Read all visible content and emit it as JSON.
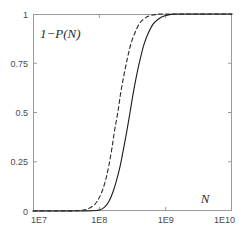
{
  "chart_data": {
    "type": "line",
    "title": "",
    "subtitle": "",
    "xlabel": "N",
    "ylabel": "1−P(N)",
    "xscale": "log",
    "yscale": "linear",
    "xlim": [
      10000000,
      10000000000
    ],
    "ylim": [
      0,
      1
    ],
    "grid": false,
    "legend": "none",
    "xticks": [
      {
        "value": 10000000,
        "label": "1E7"
      },
      {
        "value": 100000000,
        "label": "1E8"
      },
      {
        "value": 1000000000,
        "label": "1E9"
      },
      {
        "value": 10000000000,
        "label": "1E10"
      }
    ],
    "yticks": [
      {
        "value": 0,
        "label": "0"
      },
      {
        "value": 0.25,
        "label": "0.25"
      },
      {
        "value": 0.5,
        "label": "0.5"
      },
      {
        "value": 0.75,
        "label": "0.75"
      },
      {
        "value": 1,
        "label": "1"
      }
    ],
    "series": [
      {
        "name": "dashed-curve",
        "style": "dashed",
        "color": "#2b2b2b",
        "midpoint_x": 190000000,
        "points": [
          {
            "x": 10000000,
            "y": 0.0
          },
          {
            "x": 20000000,
            "y": 0.0
          },
          {
            "x": 40000000,
            "y": 0.001
          },
          {
            "x": 60000000,
            "y": 0.006
          },
          {
            "x": 80000000,
            "y": 0.025
          },
          {
            "x": 95000000,
            "y": 0.055
          },
          {
            "x": 110000000,
            "y": 0.1
          },
          {
            "x": 125000000,
            "y": 0.16
          },
          {
            "x": 140000000,
            "y": 0.235
          },
          {
            "x": 155000000,
            "y": 0.32
          },
          {
            "x": 170000000,
            "y": 0.41
          },
          {
            "x": 190000000,
            "y": 0.5
          },
          {
            "x": 210000000,
            "y": 0.6
          },
          {
            "x": 235000000,
            "y": 0.69
          },
          {
            "x": 265000000,
            "y": 0.775
          },
          {
            "x": 300000000,
            "y": 0.85
          },
          {
            "x": 345000000,
            "y": 0.905
          },
          {
            "x": 400000000,
            "y": 0.95
          },
          {
            "x": 470000000,
            "y": 0.975
          },
          {
            "x": 560000000,
            "y": 0.99
          },
          {
            "x": 700000000,
            "y": 0.997
          },
          {
            "x": 1000000000,
            "y": 1.0
          },
          {
            "x": 10000000000,
            "y": 1.0
          }
        ]
      },
      {
        "name": "solid-curve",
        "style": "solid",
        "color": "#1a1a1a",
        "midpoint_x": 290000000,
        "points": [
          {
            "x": 10000000,
            "y": 0.0
          },
          {
            "x": 40000000,
            "y": 0.0
          },
          {
            "x": 80000000,
            "y": 0.001
          },
          {
            "x": 100000000,
            "y": 0.005
          },
          {
            "x": 120000000,
            "y": 0.02
          },
          {
            "x": 140000000,
            "y": 0.05
          },
          {
            "x": 160000000,
            "y": 0.095
          },
          {
            "x": 180000000,
            "y": 0.15
          },
          {
            "x": 205000000,
            "y": 0.225
          },
          {
            "x": 230000000,
            "y": 0.31
          },
          {
            "x": 258000000,
            "y": 0.4
          },
          {
            "x": 290000000,
            "y": 0.5
          },
          {
            "x": 325000000,
            "y": 0.6
          },
          {
            "x": 365000000,
            "y": 0.69
          },
          {
            "x": 415000000,
            "y": 0.775
          },
          {
            "x": 475000000,
            "y": 0.85
          },
          {
            "x": 550000000,
            "y": 0.905
          },
          {
            "x": 650000000,
            "y": 0.95
          },
          {
            "x": 780000000,
            "y": 0.975
          },
          {
            "x": 950000000,
            "y": 0.99
          },
          {
            "x": 1200000000,
            "y": 0.998
          },
          {
            "x": 1600000000,
            "y": 1.0
          },
          {
            "x": 10000000000,
            "y": 1.0
          }
        ]
      }
    ],
    "annotations": [
      {
        "name": "y-axis-label",
        "text": "1−P(N)",
        "x_px": 40,
        "y_px": 34
      },
      {
        "name": "x-axis-label",
        "text": "N",
        "x_px": 205,
        "y_px": 199
      }
    ],
    "axes_box": {
      "left_px": 33,
      "top_px": 14,
      "right_px": 232,
      "bottom_px": 211
    },
    "axis_color": "#9a9a9a",
    "background": "#ffffff"
  }
}
